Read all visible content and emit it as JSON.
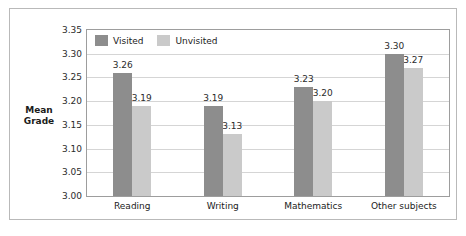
{
  "chart_data": {
    "type": "bar",
    "title": "",
    "xlabel": "",
    "ylabel_line1": "Mean",
    "ylabel_line2": "Grade",
    "ylim": [
      3.0,
      3.35
    ],
    "ytick_step": 0.05,
    "ytick_labels": [
      "3.35",
      "3.30",
      "3.25",
      "3.20",
      "3.15",
      "3.10",
      "3.05",
      "3.00"
    ],
    "ytick_values": [
      3.35,
      3.3,
      3.25,
      3.2,
      3.15,
      3.1,
      3.05,
      3.0
    ],
    "grid": true,
    "legend_position": "top-left-inside",
    "categories": [
      "Reading",
      "Writing",
      "Mathematics",
      "Other subjects"
    ],
    "series": [
      {
        "name": "Visited",
        "color": "#8d8d8d",
        "values": [
          3.26,
          3.19,
          3.23,
          3.3
        ],
        "labels": [
          "3.26",
          "3.19",
          "3.23",
          "3.30"
        ]
      },
      {
        "name": "Unvisited",
        "color": "#cacaca",
        "values": [
          3.19,
          3.13,
          3.2,
          3.27
        ],
        "labels": [
          "3.19",
          "3.13",
          "3.20",
          "3.27"
        ]
      }
    ]
  },
  "colors": {
    "visited": "#8d8d8d",
    "unvisited": "#cacaca",
    "gridline": "#d5d5d5",
    "plot_border": "#9d9d9d",
    "figure_border": "#b9b9b9",
    "text": "#1b1b1b",
    "background": "#ffffff"
  }
}
